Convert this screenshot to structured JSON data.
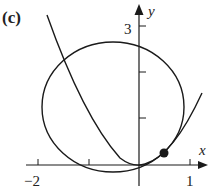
{
  "figure": {
    "panel_label": "(c)",
    "axes": {
      "x_label": "x",
      "y_label": "y",
      "x_ticks": [
        {
          "value": -2,
          "label": "−2"
        },
        {
          "value": -1,
          "label": ""
        },
        {
          "value": 0,
          "label": ""
        },
        {
          "value": 1,
          "label": "1"
        }
      ],
      "y_ticks": [
        {
          "value": 1,
          "label": ""
        },
        {
          "value": 2,
          "label": ""
        },
        {
          "value": 3,
          "label": "3"
        }
      ]
    },
    "curves": [
      {
        "name": "circle",
        "type": "circle"
      },
      {
        "name": "parabola",
        "type": "parabola"
      }
    ],
    "marked_point": {
      "name": "tangent-point"
    },
    "colors": {
      "stroke": "#1a1a1a",
      "background": "#ffffff"
    }
  }
}
